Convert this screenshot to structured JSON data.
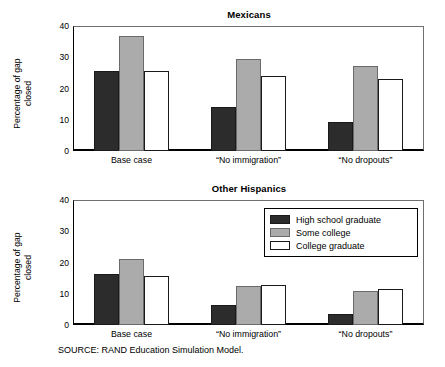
{
  "figure": {
    "source_note": "SOURCE:  RAND Education Simulation Model."
  },
  "legend": {
    "position": "upper-right-of-lower-panel",
    "entries": [
      {
        "label": "High school graduate",
        "color": "#2c2c2c",
        "name": "legend-high-school-graduate"
      },
      {
        "label": "Some college",
        "color": "#ababab",
        "name": "legend-some-college"
      },
      {
        "label": "College graduate",
        "color": "#ffffff",
        "name": "legend-college-graduate"
      }
    ]
  },
  "chart_data": [
    {
      "type": "bar",
      "title": "Mexicans",
      "xlabel": "",
      "ylabel": "Percentage of gap\nclosed",
      "ylim": [
        0,
        40
      ],
      "yticks": [
        0,
        10,
        20,
        30,
        40
      ],
      "ytick_labels": [
        "0",
        "10",
        "20",
        "30",
        "40"
      ],
      "grid": false,
      "categories": [
        "Base case",
        "“No immigration”",
        "“No dropouts”"
      ],
      "series": [
        {
          "name": "High school graduate",
          "color": "#2c2c2c",
          "values": [
            25.5,
            14.0,
            9.2
          ]
        },
        {
          "name": "Some college",
          "color": "#ababab",
          "values": [
            36.8,
            29.5,
            27.3
          ]
        },
        {
          "name": "College graduate",
          "color": "#ffffff",
          "values": [
            25.7,
            24.1,
            23.2
          ]
        }
      ]
    },
    {
      "type": "bar",
      "title": "Other Hispanics",
      "xlabel": "",
      "ylabel": "Percentage of gap\nclosed",
      "ylim": [
        0,
        40
      ],
      "yticks": [
        0,
        10,
        20,
        30,
        40
      ],
      "ytick_labels": [
        "0",
        "10",
        "20",
        "30",
        "40"
      ],
      "grid": false,
      "categories": [
        "Base case",
        "“No immigration”",
        "“No dropouts”"
      ],
      "series": [
        {
          "name": "High school graduate",
          "color": "#2c2c2c",
          "values": [
            16.2,
            6.5,
            3.6
          ]
        },
        {
          "name": "Some college",
          "color": "#ababab",
          "values": [
            21.0,
            12.6,
            11.0
          ]
        },
        {
          "name": "College graduate",
          "color": "#ffffff",
          "values": [
            15.6,
            12.8,
            11.6
          ]
        }
      ]
    }
  ]
}
